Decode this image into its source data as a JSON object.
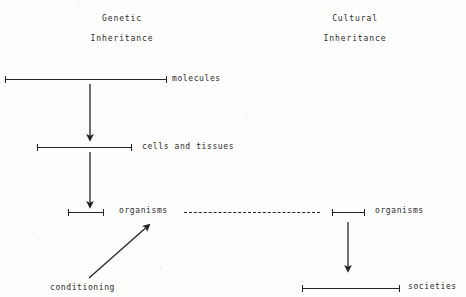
{
  "diagram": {
    "background_color": "#fdfdfc",
    "ink_color": "#242424",
    "headings": [
      {
        "id": "genetic",
        "line1": "Genetic",
        "line2": "Inheritance",
        "x": 62,
        "y": 14,
        "width": 120
      },
      {
        "id": "cultural",
        "line1": "Cultural",
        "line2": "Inheritance",
        "x": 295,
        "y": 14,
        "width": 120
      }
    ],
    "levels": [
      {
        "id": "molecules",
        "label": "molecules",
        "bar_x": 5,
        "bar_y": 79,
        "bar_w": 162,
        "label_x": 172,
        "label_y": 74
      },
      {
        "id": "cells-tissues",
        "label": "cells and tissues",
        "bar_x": 37,
        "bar_y": 147,
        "bar_w": 95,
        "label_x": 142,
        "label_y": 142
      },
      {
        "id": "organisms-left",
        "label": "organisms",
        "bar_x": 68,
        "bar_y": 212,
        "bar_w": 36,
        "label_x": 119,
        "label_y": 206
      },
      {
        "id": "organisms-right",
        "label": "organisms",
        "bar_x": 332,
        "bar_y": 212,
        "bar_w": 33,
        "label_x": 375,
        "label_y": 206
      },
      {
        "id": "societies",
        "label": "societies",
        "bar_x": 302,
        "bar_y": 288,
        "bar_w": 98,
        "label_x": 408,
        "label_y": 282
      }
    ],
    "annotations": [
      {
        "id": "conditioning",
        "label": "conditioning",
        "x": 50,
        "y": 283
      }
    ],
    "connectors": [
      {
        "id": "molecules-to-cells",
        "kind": "arrow",
        "x1": 90,
        "y1": 84,
        "x2": 90,
        "y2": 141
      },
      {
        "id": "cells-to-organisms",
        "kind": "arrow",
        "x1": 90,
        "y1": 152,
        "x2": 90,
        "y2": 208
      },
      {
        "id": "organisms-to-societies",
        "kind": "arrow",
        "x1": 348,
        "y1": 222,
        "x2": 348,
        "y2": 272
      },
      {
        "id": "conditioning-to-organisms",
        "kind": "arrow",
        "x1": 89,
        "y1": 278,
        "x2": 150,
        "y2": 224
      },
      {
        "id": "genetic-cultural-link",
        "kind": "dashed",
        "x1": 184,
        "y1": 212,
        "x2": 320,
        "y2": 212
      }
    ]
  }
}
